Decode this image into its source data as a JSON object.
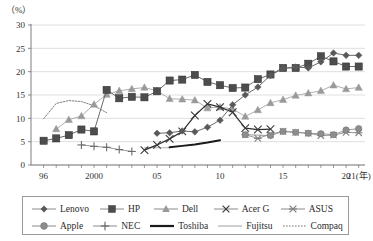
{
  "axis_unit_label": "（%）",
  "chart_data": {
    "type": "line",
    "title": "",
    "xlabel": "(年)",
    "ylabel": "(%)",
    "ylim": [
      0,
      30
    ],
    "yticks": [
      0,
      5,
      10,
      15,
      20,
      25,
      30
    ],
    "xlim": [
      1995,
      2021.5
    ],
    "xticks_major": [
      1996,
      2000,
      2005,
      2010,
      2015,
      2020,
      2021
    ],
    "xticklabels": [
      "96",
      "2000",
      "05",
      "10",
      "15",
      "20",
      "21(年)"
    ],
    "grid": "horizontal",
    "legend_position": "below",
    "series": [
      {
        "name": "Lenovo",
        "marker": "diamond",
        "color": "#595959",
        "x": [
          2005,
          2006,
          2007,
          2008,
          2009,
          2010,
          2011,
          2012,
          2013,
          2014,
          2015,
          2016,
          2017,
          2018,
          2019,
          2020,
          2021
        ],
        "values": [
          6.8,
          6.9,
          7.3,
          7.1,
          8.1,
          9.6,
          12.9,
          15.0,
          16.7,
          19.2,
          20.7,
          21.0,
          20.8,
          22.1,
          24.0,
          23.5,
          23.5
        ]
      },
      {
        "name": "HP",
        "marker": "square",
        "color": "#4d4d4d",
        "x": [
          1996,
          1997,
          1998,
          1999,
          2000,
          2001,
          2002,
          2003,
          2004,
          2005,
          2006,
          2007,
          2008,
          2009,
          2010,
          2011,
          2012,
          2013,
          2014,
          2015,
          2016,
          2017,
          2018,
          2019,
          2020,
          2021
        ],
        "values": [
          5.2,
          5.7,
          6.4,
          7.6,
          7.2,
          16.1,
          14.3,
          14.6,
          14.5,
          15.8,
          18.1,
          18.3,
          19.3,
          17.8,
          17.1,
          16.5,
          16.6,
          18.4,
          19.4,
          20.8,
          20.8,
          21.7,
          23.3,
          22.2,
          21.1,
          21.1
        ]
      },
      {
        "name": "Dell",
        "marker": "triangle",
        "color": "#9a9a9a",
        "x": [
          1997,
          1998,
          1999,
          2000,
          2001,
          2002,
          2003,
          2004,
          2005,
          2006,
          2007,
          2008,
          2009,
          2010,
          2011,
          2012,
          2013,
          2014,
          2015,
          2016,
          2017,
          2018,
          2019,
          2020,
          2021
        ],
        "values": [
          7.7,
          9.7,
          10.5,
          13.0,
          15.1,
          15.9,
          16.3,
          16.6,
          15.9,
          14.2,
          14.1,
          13.9,
          12.2,
          12.4,
          12.0,
          10.4,
          11.8,
          13.3,
          14.0,
          14.9,
          15.4,
          15.9,
          17.1,
          16.3,
          16.6
        ]
      },
      {
        "name": "Acer G",
        "marker": "x",
        "color": "#3a3a3a",
        "x": [
          2004,
          2005,
          2006,
          2007,
          2008,
          2009,
          2010,
          2011,
          2012,
          2013,
          2014
        ],
        "values": [
          3.2,
          4.3,
          5.6,
          7.2,
          10.6,
          13.1,
          12.4,
          11.3,
          7.9,
          7.6,
          7.7
        ]
      },
      {
        "name": "ASUS",
        "marker": "asterisk",
        "color": "#808080",
        "x": [
          2012,
          2013,
          2014,
          2015,
          2016,
          2017,
          2018,
          2019,
          2020,
          2021
        ],
        "values": [
          6.5,
          5.7,
          6.6,
          7.2,
          7.0,
          6.8,
          6.3,
          6.4,
          7.0,
          6.9
        ]
      },
      {
        "name": "Apple",
        "marker": "circle",
        "color": "#8d8d8d",
        "x": [
          2012,
          2014,
          2015,
          2016,
          2017,
          2018,
          2019,
          2020,
          2021
        ],
        "values": [
          6.5,
          6.3,
          7.2,
          7.0,
          6.8,
          6.7,
          6.5,
          7.5,
          7.8
        ]
      },
      {
        "name": "NEC",
        "marker": "plus",
        "color": "#6a6a6a",
        "x": [
          1999,
          2000,
          2001,
          2002,
          2003
        ],
        "values": [
          4.3,
          4.0,
          3.8,
          3.3,
          2.9
        ]
      },
      {
        "name": "Toshiba",
        "marker": "none",
        "style": "thick-line",
        "color": "#1a1a1a",
        "x": [
          2006,
          2007,
          2008,
          2009,
          2010
        ],
        "values": [
          3.8,
          4.1,
          4.4,
          4.8,
          5.3
        ]
      },
      {
        "name": "Fujitsu",
        "marker": "none",
        "style": "thin-line",
        "color": "#b0b0b0",
        "x": [
          2004,
          2005,
          2006
        ],
        "values": [
          3.7,
          3.7,
          3.7
        ]
      },
      {
        "name": "Compaq",
        "marker": "none",
        "style": "dotted-line",
        "color": "#707070",
        "x": [
          1996,
          1997,
          1998,
          1999,
          2000,
          2001
        ],
        "values": [
          9.9,
          13.2,
          13.8,
          13.6,
          12.7,
          11.2
        ]
      }
    ]
  },
  "legend": {
    "rows": [
      [
        {
          "label": "Lenovo",
          "marker": "diamond",
          "color": "#595959"
        },
        {
          "label": "HP",
          "marker": "square",
          "color": "#4d4d4d"
        },
        {
          "label": "Dell",
          "marker": "triangle",
          "color": "#9a9a9a"
        },
        {
          "label": "Acer G",
          "marker": "x",
          "color": "#3a3a3a"
        },
        {
          "label": "ASUS",
          "marker": "asterisk",
          "color": "#808080"
        }
      ],
      [
        {
          "label": "Apple",
          "marker": "circle",
          "color": "#8d8d8d"
        },
        {
          "label": "NEC",
          "marker": "plus",
          "color": "#6a6a6a"
        },
        {
          "label": "Toshiba",
          "marker": "thick-line",
          "color": "#1a1a1a"
        },
        {
          "label": "Fujitsu",
          "marker": "thin-line",
          "color": "#b0b0b0"
        },
        {
          "label": "Compaq",
          "marker": "dotted-line",
          "color": "#707070"
        }
      ]
    ]
  }
}
